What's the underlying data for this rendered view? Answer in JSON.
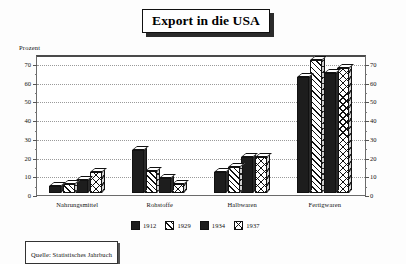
{
  "title": "Export in die USA",
  "axis_unit_label": "Prozent",
  "source_note": "Quelle: Statistisches Jahrbuch",
  "chart_data": {
    "type": "bar",
    "title": "Export in die USA",
    "xlabel": "",
    "ylabel": "Prozent",
    "ylim": [
      0,
      70
    ],
    "yticks": [
      0,
      10,
      20,
      30,
      40,
      50,
      60,
      70
    ],
    "grid": true,
    "legend_position": "bottom",
    "dual_axis": true,
    "right_yticks": [
      0,
      10,
      20,
      30,
      40,
      50,
      60,
      70
    ],
    "categories": [
      "Nahrungsmittel",
      "Rohstoffe",
      "Halbwaren",
      "Fertigwaren"
    ],
    "series": [
      {
        "name": "1912",
        "pattern": "solid",
        "values": [
          4,
          23,
          11,
          62
        ]
      },
      {
        "name": "1929",
        "pattern": "diagonal",
        "values": [
          5,
          12,
          14,
          71
        ]
      },
      {
        "name": "1934",
        "pattern": "solid",
        "values": [
          7,
          8,
          19,
          64
        ]
      },
      {
        "name": "1937",
        "pattern": "crosshatch",
        "values": [
          11,
          5,
          19,
          67
        ]
      }
    ]
  },
  "ylabels": {
    "t0": "0",
    "t10": "10",
    "t20": "20",
    "t30": "30",
    "t40": "40",
    "t50": "50",
    "t60": "60",
    "t70": "70"
  },
  "ylabels_right": {
    "t0": "0",
    "t10": "10",
    "t20": "20",
    "t30": "30",
    "t40": "40",
    "t50": "50",
    "t60": "60",
    "t70": "70"
  },
  "categories": {
    "c0": "Nahrungsmittel",
    "c1": "Rohstoffe",
    "c2": "Halbwaren",
    "c3": "Fertigwaren"
  },
  "legend": {
    "i0": "1912",
    "i1": "1929",
    "i2": "1934",
    "i3": "1937"
  },
  "colors": {
    "ink": "#111111",
    "bar_solid": "#1d1d1d",
    "plot_background": "#ffffff",
    "gridline": "#9a9a9a",
    "frame": "#6b6b6b"
  }
}
